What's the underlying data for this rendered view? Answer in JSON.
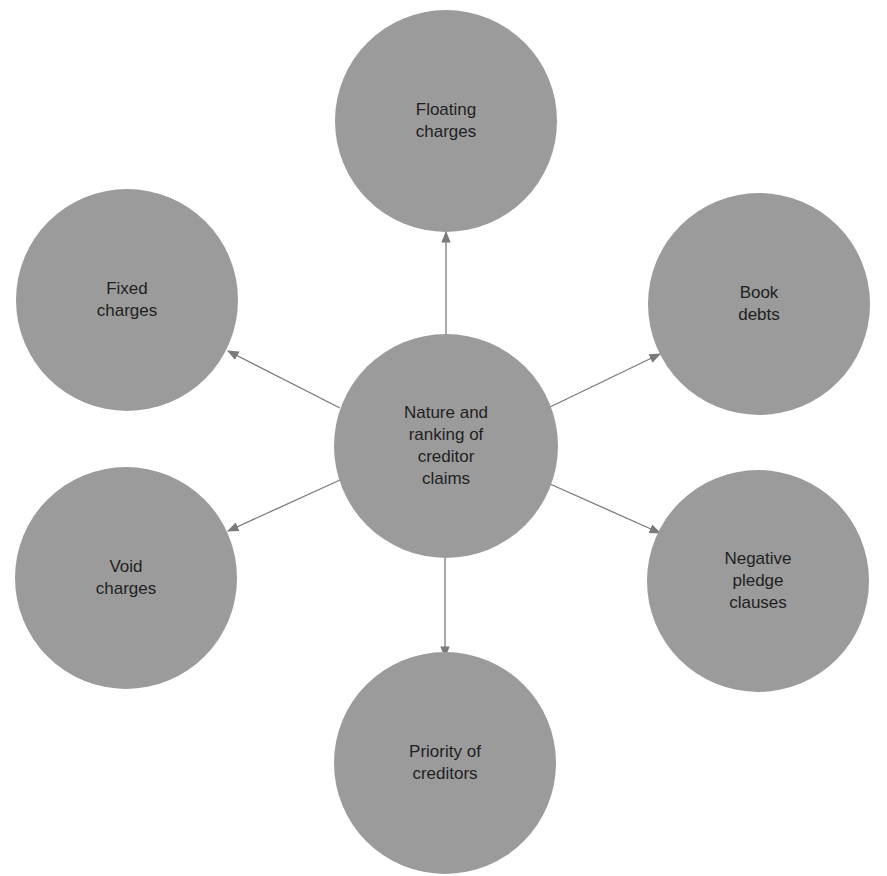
{
  "diagram": {
    "type": "hub-and-spoke",
    "colors": {
      "node_fill": "#9b9b9b",
      "edge": "#7a7a7a",
      "text": "#1f1f1f",
      "background": "#ffffff"
    },
    "center": {
      "label": "Nature and\nranking of\ncreditor\nclaims",
      "cx": 446,
      "cy": 446,
      "r": 112
    },
    "nodes": [
      {
        "id": "floating-charges",
        "label": "Floating\ncharges",
        "cx": 446,
        "cy": 121,
        "r": 111
      },
      {
        "id": "book-debts",
        "label": "Book\ndebts",
        "cx": 759,
        "cy": 304,
        "r": 111
      },
      {
        "id": "negative-pledge-clauses",
        "label": "Negative\npledge\nclauses",
        "cx": 758,
        "cy": 581,
        "r": 111
      },
      {
        "id": "priority-of-creditors",
        "label": "Priority of\ncreditors",
        "cx": 445,
        "cy": 763,
        "r": 111
      },
      {
        "id": "void-charges",
        "label": "Void\ncharges",
        "cx": 126,
        "cy": 578,
        "r": 111
      },
      {
        "id": "fixed-charges",
        "label": "Fixed\ncharges",
        "cx": 127,
        "cy": 300,
        "r": 111
      }
    ],
    "edges": [
      {
        "from": "center",
        "to": "floating-charges",
        "x1": 446,
        "y1": 334,
        "x2": 446,
        "y2": 232
      },
      {
        "from": "center",
        "to": "book-debts",
        "x1": 550,
        "y1": 407,
        "x2": 660,
        "y2": 354
      },
      {
        "from": "center",
        "to": "negative-pledge-clauses",
        "x1": 550,
        "y1": 484,
        "x2": 660,
        "y2": 533
      },
      {
        "from": "center",
        "to": "priority-of-creditors",
        "x1": 445,
        "y1": 558,
        "x2": 445,
        "y2": 657
      },
      {
        "from": "center",
        "to": "void-charges",
        "x1": 340,
        "y1": 480,
        "x2": 228,
        "y2": 531
      },
      {
        "from": "center",
        "to": "fixed-charges",
        "x1": 340,
        "y1": 408,
        "x2": 228,
        "y2": 351
      }
    ]
  }
}
